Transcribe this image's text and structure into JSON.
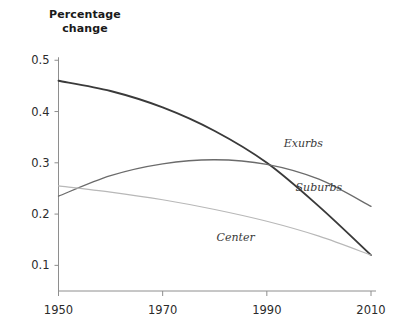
{
  "chart_data": {
    "type": "line",
    "title": "",
    "subtitle": "",
    "ylabel_line1": "Percentage",
    "ylabel_line2": "change",
    "xlabel": "",
    "x": [
      1950,
      1960,
      1970,
      1980,
      1990,
      2000,
      2010
    ],
    "xlim": [
      1950,
      2010
    ],
    "ylim": [
      0.05,
      0.52
    ],
    "xticks": [
      "1950",
      "1970",
      "1990",
      "2010"
    ],
    "xtick_values": [
      1950,
      1970,
      1990,
      2010
    ],
    "yticks": [
      "0.5",
      "0.4",
      "0.3",
      "0.2",
      "0.1"
    ],
    "ytick_values": [
      0.5,
      0.4,
      0.3,
      0.2,
      0.1
    ],
    "grid": false,
    "legend": "inline-labels",
    "series": [
      {
        "name": "Suburbs",
        "color": "#3a3a3a",
        "width": 1.9,
        "label_x": 2000,
        "label_y": 0.245,
        "values": [
          0.46,
          0.44,
          0.408,
          0.362,
          0.3,
          0.215,
          0.12
        ]
      },
      {
        "name": "Exurbs",
        "color": "#6b6b6b",
        "width": 1.3,
        "label_x": 1997,
        "label_y": 0.33,
        "values": [
          0.235,
          0.275,
          0.298,
          0.306,
          0.297,
          0.268,
          0.215
        ]
      },
      {
        "name": "Center",
        "color": "#b8b8b8",
        "width": 1.2,
        "label_x": 1984,
        "label_y": 0.148,
        "values": [
          0.255,
          0.243,
          0.228,
          0.209,
          0.186,
          0.157,
          0.12
        ]
      }
    ]
  }
}
